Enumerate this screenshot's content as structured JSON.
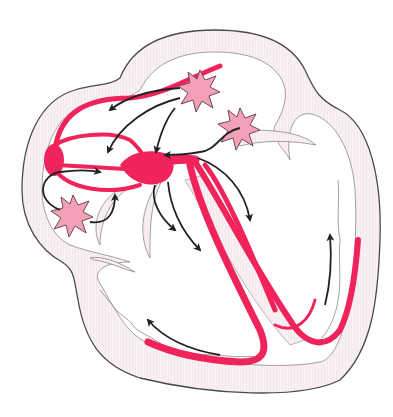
{
  "diagram": {
    "text_labels": [],
    "colors": {
      "background": "#ffffff",
      "heart_wall_fill": "#f8eef3",
      "outline": "#4a4a4a",
      "inner_outline": "#8a8a8a",
      "conduction_pathway": "#f0245a",
      "ectopic_focus_fill": "#f4a0b8",
      "ectopic_focus_stroke": "#6a4a55",
      "arrow": "#222222"
    },
    "structures": [
      {
        "id": "sa-node",
        "kind": "conduction-node"
      },
      {
        "id": "av-node",
        "kind": "conduction-node"
      },
      {
        "id": "internodal-pathways",
        "kind": "conduction-pathway"
      },
      {
        "id": "bundle-of-his",
        "kind": "conduction-pathway"
      },
      {
        "id": "left-bundle-branch",
        "kind": "conduction-pathway"
      },
      {
        "id": "right-bundle-branch",
        "kind": "conduction-pathway"
      },
      {
        "id": "purkinje-fibers",
        "kind": "conduction-pathway"
      }
    ],
    "ectopic_foci": [
      {
        "id": "focus-top",
        "x": 200,
        "y": 88
      },
      {
        "id": "focus-right",
        "x": 240,
        "y": 128
      },
      {
        "id": "focus-left",
        "x": 72,
        "y": 215
      }
    ],
    "arrows_count": 11
  }
}
